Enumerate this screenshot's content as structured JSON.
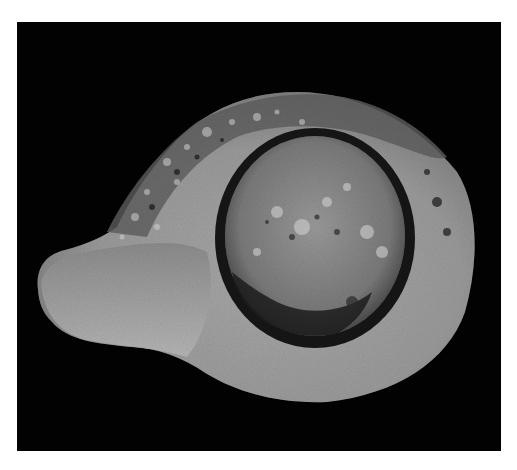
{
  "image": {
    "subject": "Ancient oil lamp artifact, top view",
    "style": "grayscale photograph on black background",
    "colors": {
      "page_background": "#ffffff",
      "photo_background": "#020202",
      "body_light": "#b5b5b5",
      "body_mid": "#8c8c8c",
      "body_dark": "#4a4a4a",
      "ring_dark": "#151515",
      "discus_fill": "#7d7d7d"
    }
  }
}
